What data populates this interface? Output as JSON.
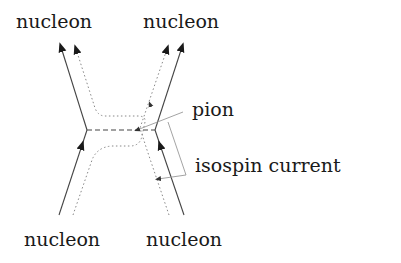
{
  "diagram": {
    "type": "feynman-diagram",
    "labels": {
      "top_left": "nucleon",
      "top_right": "nucleon",
      "bottom_left": "nucleon",
      "bottom_right": "nucleon",
      "pion": "pion",
      "isospin_current": "isospin current"
    },
    "colors": {
      "line": "#333333",
      "dotted": "#888888",
      "pointer": "#999999",
      "text": "#1a1a1a"
    },
    "lines": [
      {
        "name": "left-nucleon",
        "style": "solid",
        "path": [
          [
            59,
            215
          ],
          [
            87,
            130
          ],
          [
            61,
            47
          ]
        ],
        "arrows": [
          "mid-up",
          "end"
        ]
      },
      {
        "name": "right-nucleon",
        "style": "solid",
        "path": [
          [
            184,
            215
          ],
          [
            155,
            130
          ],
          [
            182,
            47
          ]
        ],
        "arrows": [
          "mid-up",
          "end"
        ]
      },
      {
        "name": "pion-exchange",
        "style": "dashed",
        "path": [
          [
            87,
            130
          ],
          [
            155,
            130
          ]
        ]
      },
      {
        "name": "left-isospin-flow",
        "style": "dotted",
        "arrows": [
          "end"
        ]
      },
      {
        "name": "right-isospin-flow",
        "style": "dotted",
        "arrows": [
          "end"
        ]
      }
    ]
  }
}
